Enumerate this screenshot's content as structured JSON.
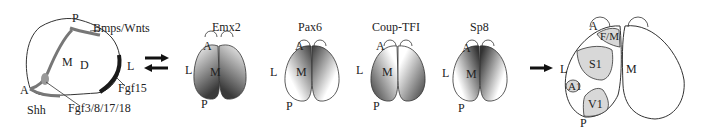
{
  "panel_a": {
    "labels": {
      "P": "P",
      "bmps_wnts": "Bmps/Wnts",
      "M": "M",
      "D": "D",
      "L": "L",
      "A": "A",
      "fgf15": "Fgf15",
      "shh": "Shh",
      "fgf3_8_17_18": "Fgf3/8/17/18"
    }
  },
  "brains": [
    {
      "title": "Emx2",
      "A": "A",
      "L": "L",
      "M": "M",
      "P": "P"
    },
    {
      "title": "Pax6",
      "A": "A",
      "L": "L",
      "M": "M",
      "P": "P"
    },
    {
      "title": "Coup-TFI",
      "A": "A",
      "L": "L",
      "M": "M",
      "P": "P"
    },
    {
      "title": "Sp8",
      "A": "A",
      "L": "L",
      "M": "M",
      "P": "P"
    }
  ],
  "panel_c": {
    "labels": {
      "A": "A",
      "FM": "F/M",
      "L": "L",
      "S1": "S1",
      "M": "M",
      "A1": "A1",
      "V1": "V1",
      "P": "P"
    }
  },
  "colors": {
    "outline": "#333333",
    "signal_gray": "#777777",
    "signal_dark": "#1a1a1a",
    "area_fill": "#d8d8d8",
    "gradient_dark": "#3a3a3a"
  }
}
